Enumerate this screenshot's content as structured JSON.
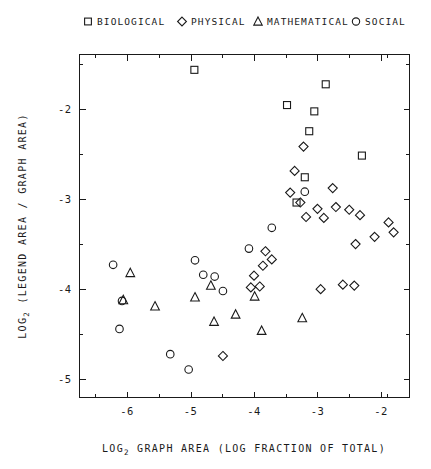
{
  "chart_data": {
    "type": "scatter",
    "title": "",
    "xlabel": "LOG2 GRAPH AREA (LOG FRACTION OF TOTAL)",
    "ylabel": "LOG2 (LEGEND AREA / GRAPH AREA)",
    "xlabel_prefix": "LOG",
    "xlabel_sub": "2",
    "xlabel_rest": " GRAPH AREA (LOG FRACTION OF TOTAL)",
    "ylabel_prefix": "LOG",
    "ylabel_sub": "2",
    "ylabel_rest": " (LEGEND AREA / GRAPH AREA)",
    "xlim": [
      -6.75,
      -1.55
    ],
    "ylim": [
      -5.2,
      -1.4
    ],
    "xticks": [
      -6,
      -5,
      -4,
      -3,
      -2
    ],
    "xticklabels": [
      "-6",
      "-5",
      "-4",
      "-3",
      "-2"
    ],
    "xminorticks": [
      -6.5,
      -5.5,
      -4.5,
      -3.5,
      -2.5,
      -1.9
    ],
    "yticks": [
      -2,
      -3,
      -4,
      -5
    ],
    "yticklabels": [
      "-2",
      "-3",
      "-4",
      "-5"
    ],
    "yminorticks": [
      -1.5,
      -2.5,
      -3.5,
      -4.5
    ],
    "grid": false,
    "legend_position": "above-plot",
    "legend": [
      {
        "label": "BIOLOGICAL",
        "marker": "square"
      },
      {
        "label": "PHYSICAL",
        "marker": "diamond"
      },
      {
        "label": "MATHEMATICAL",
        "marker": "triangle"
      },
      {
        "label": "SOCIAL",
        "marker": "circle"
      }
    ],
    "series": [
      {
        "name": "BIOLOGICAL",
        "marker": "square",
        "points": [
          [
            -4.94,
            -1.57
          ],
          [
            -3.48,
            -1.96
          ],
          [
            -2.87,
            -1.73
          ],
          [
            -3.05,
            -2.03
          ],
          [
            -3.13,
            -2.25
          ],
          [
            -2.3,
            -2.52
          ],
          [
            -3.2,
            -2.76
          ],
          [
            -3.33,
            -3.04
          ]
        ]
      },
      {
        "name": "PHYSICAL",
        "marker": "diamond",
        "points": [
          [
            -3.22,
            -2.42
          ],
          [
            -3.36,
            -2.69
          ],
          [
            -3.43,
            -2.93
          ],
          [
            -2.76,
            -2.88
          ],
          [
            -3.27,
            -3.04
          ],
          [
            -3.0,
            -3.11
          ],
          [
            -2.9,
            -3.21
          ],
          [
            -3.18,
            -3.2
          ],
          [
            -2.71,
            -3.09
          ],
          [
            -2.5,
            -3.12
          ],
          [
            -2.33,
            -3.18
          ],
          [
            -1.88,
            -3.26
          ],
          [
            -2.1,
            -3.42
          ],
          [
            -2.4,
            -3.5
          ],
          [
            -1.8,
            -3.37
          ],
          [
            -2.6,
            -3.95
          ],
          [
            -2.42,
            -3.96
          ],
          [
            -3.82,
            -3.58
          ],
          [
            -3.72,
            -3.67
          ],
          [
            -3.86,
            -3.74
          ],
          [
            -3.91,
            -3.97
          ],
          [
            -4.05,
            -3.98
          ],
          [
            -4.0,
            -3.85
          ],
          [
            -4.49,
            -4.74
          ],
          [
            -2.95,
            -4.0
          ]
        ]
      },
      {
        "name": "MATHEMATICAL",
        "marker": "triangle",
        "points": [
          [
            -5.95,
            -3.82
          ],
          [
            -6.06,
            -4.12
          ],
          [
            -5.56,
            -4.19
          ],
          [
            -4.63,
            -4.36
          ],
          [
            -4.29,
            -4.28
          ],
          [
            -3.99,
            -4.08
          ],
          [
            -3.88,
            -4.46
          ],
          [
            -3.24,
            -4.32
          ],
          [
            -4.93,
            -4.09
          ],
          [
            -4.68,
            -3.96
          ]
        ]
      },
      {
        "name": "SOCIAL",
        "marker": "circle",
        "points": [
          [
            -6.22,
            -3.73
          ],
          [
            -6.08,
            -4.13
          ],
          [
            -6.12,
            -4.44
          ],
          [
            -5.32,
            -4.72
          ],
          [
            -5.03,
            -4.89
          ],
          [
            -4.8,
            -3.84
          ],
          [
            -4.62,
            -3.86
          ],
          [
            -4.49,
            -4.02
          ],
          [
            -4.08,
            -3.55
          ],
          [
            -3.72,
            -3.32
          ],
          [
            -3.2,
            -2.92
          ],
          [
            -4.93,
            -3.68
          ]
        ]
      }
    ]
  },
  "axis": {
    "x_ticklabels": [
      "-6",
      "-5",
      "-4",
      "-3",
      "-2"
    ],
    "y_ticklabels": [
      "-2",
      "-3",
      "-4",
      "-5"
    ]
  }
}
